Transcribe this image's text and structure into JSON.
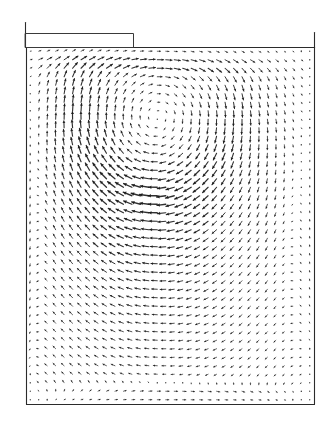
{
  "figure": {
    "title": "",
    "background_color": "#ffffff",
    "width": 335,
    "height": 430
  },
  "chart_data": {
    "type": "quiver",
    "title": "",
    "subtitle": "",
    "xlabel": "",
    "ylabel": "",
    "grid": false,
    "legend": false,
    "axis_visible": false,
    "tick_labels_x": [],
    "tick_labels_y": [],
    "arrow_color": "#1a1a1a",
    "domain": {
      "x_min_px": 26,
      "x_max_px": 314,
      "y_min_px": 47,
      "y_max_px": 404,
      "xlim": [
        0.0,
        1.0
      ],
      "ylim": [
        0.0,
        1.0
      ]
    },
    "grid_spec": {
      "n_cols": 34,
      "n_rows": 42,
      "spacing_px": 8.5,
      "origin_px": [
        30,
        52
      ]
    },
    "arrow_scale_px": 9.5,
    "arrow_head_px": 2.6,
    "min_dot_px": 1.15,
    "vortices": [
      {
        "name": "primary-vortex",
        "center_px": [
          155,
          90
        ],
        "center_norm": [
          0.448,
          0.88
        ],
        "rotation": "clockwise",
        "strength": 1.0,
        "core_radius_norm": 0.3
      },
      {
        "name": "secondary-recirculation",
        "center_px": [
          170,
          265
        ],
        "center_norm": [
          0.5,
          0.39
        ],
        "rotation": "clockwise",
        "strength": 0.34,
        "core_radius_norm": 0.55
      }
    ],
    "jet": {
      "name": "inlet-shear-jet",
      "y_norm": 0.985,
      "x_start_norm": 0.0,
      "x_end_norm": 0.78,
      "u_max": 1.35,
      "thickness_norm": 0.045
    },
    "boundaries": {
      "walls": "no-slip",
      "top_left_channel": true
    }
  },
  "geometry": {
    "cavity_outline": {
      "name": "cavity-wall",
      "left_px": 26,
      "right_px": 314,
      "top_px": 47,
      "bottom_px": 404,
      "stroke": "#2b2b2b",
      "stroke_width": 1.1
    },
    "left_wall_upper": {
      "name": "left-wall-upper-extension",
      "x_px": 25,
      "y_top_px": 22,
      "y_bottom_px": 47,
      "stroke": "#2b2b2b",
      "stroke_width": 1.1
    },
    "right_wall_upper": {
      "name": "right-wall-upper-extension",
      "x_px": 314,
      "y_top_px": 32,
      "y_bottom_px": 47,
      "stroke": "#2b2b2b",
      "stroke_width": 1.1
    },
    "inlet_box": {
      "name": "inlet-channel-box",
      "left_px": 25,
      "right_px": 133,
      "top_px": 33,
      "bottom_px": 47,
      "stroke": "#3a3a3a",
      "stroke_width": 1.0,
      "fill": "none"
    },
    "top_lid_line": {
      "name": "top-lid-line",
      "x_start_px": 26,
      "x_end_px": 314,
      "y_px": 47,
      "stroke": "#2b2b2b",
      "stroke_width": 1.0
    }
  },
  "colors": {
    "ink": "#1a1a1a",
    "wall": "#2b2b2b",
    "paper": "#ffffff"
  },
  "labels": {
    "caption": "",
    "axis_note": ""
  }
}
